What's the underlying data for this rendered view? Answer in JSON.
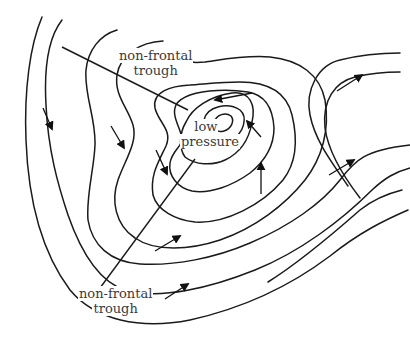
{
  "diagram": {
    "type": "weather-map-isobars",
    "labels": {
      "trough_top_line1": "non-frontal",
      "trough_top_line2": "trough",
      "center_line1": "low",
      "center_line2": "pressure",
      "trough_bottom_line1": "non-frontal",
      "trough_bottom_line2": "trough"
    },
    "elements": {
      "isobar_count": 8,
      "wind_arrow_count": 11,
      "trough_line_count": 2
    },
    "colors": {
      "line": "#1a1a1a",
      "text": "#3a3a3a",
      "background": "#ffffff"
    }
  }
}
